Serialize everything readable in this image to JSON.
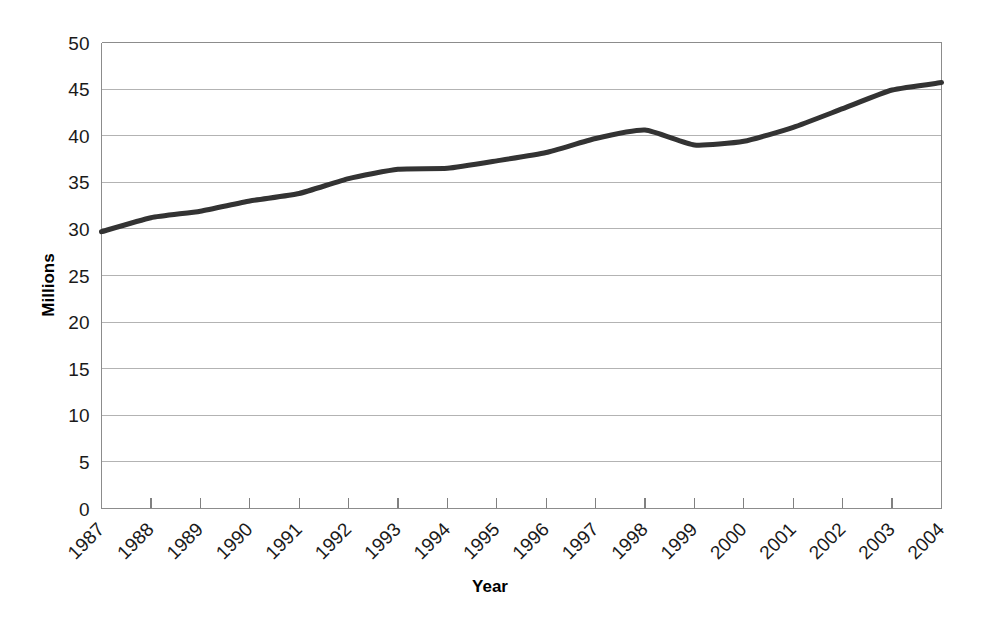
{
  "chart_data": {
    "type": "line",
    "title": "",
    "subtitle": "",
    "xlabel": "Year",
    "ylabel": "Millions",
    "x": [
      1987,
      1988,
      1989,
      1990,
      1991,
      1992,
      1993,
      1994,
      1995,
      1996,
      1997,
      1998,
      1999,
      2000,
      2001,
      2002,
      2003,
      2004
    ],
    "categories": [
      "1987",
      "1988",
      "1989",
      "1990",
      "1991",
      "1992",
      "1993",
      "1994",
      "1995",
      "1996",
      "1997",
      "1998",
      "1999",
      "2000",
      "2001",
      "2002",
      "2003",
      "2004"
    ],
    "values": [
      29.7,
      31.2,
      31.9,
      33.0,
      33.8,
      35.4,
      36.4,
      36.5,
      37.3,
      38.2,
      39.7,
      40.6,
      39.0,
      39.4,
      40.9,
      42.9,
      44.9,
      45.7
    ],
    "series": [
      {
        "name": "Millions",
        "values": [
          29.7,
          31.2,
          31.9,
          33.0,
          33.8,
          35.4,
          36.4,
          36.5,
          37.3,
          38.2,
          39.7,
          40.6,
          39.0,
          39.4,
          40.9,
          42.9,
          44.9,
          45.7
        ],
        "color": "#333333"
      }
    ],
    "ylim": [
      0,
      50
    ],
    "yticks": [
      0,
      5,
      10,
      15,
      20,
      25,
      30,
      35,
      40,
      45,
      50
    ],
    "ytick_labels": [
      "0",
      "5",
      "10",
      "15",
      "20",
      "25",
      "30",
      "35",
      "40",
      "45",
      "50"
    ],
    "xtick_labels": [
      "1987",
      "1988",
      "1989",
      "1990",
      "1991",
      "1992",
      "1993",
      "1994",
      "1995",
      "1996",
      "1997",
      "1998",
      "1999",
      "2000",
      "2001",
      "2002",
      "2003",
      "2004"
    ],
    "grid": true,
    "grid_axis": "y",
    "legend": false,
    "legend_position": "none",
    "line_color": "#333333",
    "line_width": 5,
    "grid_color": "#b3b3b3",
    "frame_color": "#8c8c8c",
    "background_color": "#ffffff",
    "xtick_label_rotation": -45
  }
}
